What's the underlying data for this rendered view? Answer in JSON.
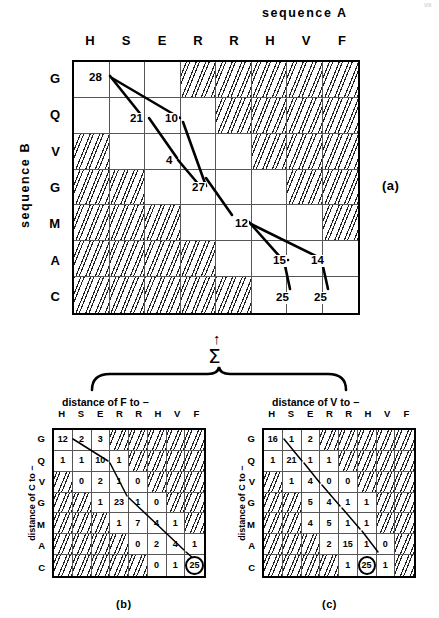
{
  "figure": {
    "sequence_a_title": "sequence A",
    "sequence_b_title": "sequence B",
    "panel_a_tag": "(a)",
    "panel_b_tag": "(b)",
    "panel_c_tag": "(c)",
    "sigma_symbol": "Σ",
    "arrow_symbol": "↑",
    "corner_mark": "VIII"
  },
  "panel_a": {
    "columns": [
      "H",
      "S",
      "E",
      "R",
      "R",
      "H",
      "V",
      "F"
    ],
    "rows": [
      "G",
      "Q",
      "V",
      "G",
      "M",
      "A",
      "C"
    ],
    "hatched": [
      [
        false,
        false,
        false,
        true,
        true,
        true,
        true,
        true
      ],
      [
        false,
        false,
        false,
        false,
        true,
        true,
        true,
        true
      ],
      [
        true,
        false,
        false,
        false,
        false,
        true,
        true,
        true
      ],
      [
        true,
        true,
        false,
        false,
        false,
        false,
        true,
        true
      ],
      [
        true,
        true,
        true,
        false,
        false,
        false,
        false,
        true
      ],
      [
        true,
        true,
        true,
        true,
        false,
        false,
        false,
        false
      ],
      [
        true,
        true,
        true,
        true,
        true,
        false,
        false,
        false
      ]
    ],
    "path_labels": [
      {
        "text": "28",
        "x": 88,
        "y": 72
      },
      {
        "text": "21",
        "x": 129,
        "y": 113
      },
      {
        "text": "10",
        "x": 164,
        "y": 113
      },
      {
        "text": "4",
        "x": 165,
        "y": 155
      },
      {
        "text": "27",
        "x": 191,
        "y": 182
      },
      {
        "text": "12",
        "x": 234,
        "y": 218
      },
      {
        "text": "15",
        "x": 272,
        "y": 255
      },
      {
        "text": "14",
        "x": 310,
        "y": 255
      },
      {
        "text": "25",
        "x": 275,
        "y": 292
      },
      {
        "text": "25",
        "x": 313,
        "y": 292
      }
    ]
  },
  "panel_b": {
    "title": "distance of  F to −",
    "side_label": "distance of C to −",
    "columns": [
      "H",
      "S",
      "E",
      "R",
      "R",
      "H",
      "V",
      "F"
    ],
    "rows": [
      "G",
      "Q",
      "V",
      "G",
      "M",
      "A",
      "C"
    ],
    "values": [
      [
        "12",
        "2",
        "3",
        "",
        "",
        "",
        "",
        ""
      ],
      [
        "1",
        "1",
        "10",
        "1",
        "",
        "",
        "",
        ""
      ],
      [
        "",
        "0",
        "2",
        "1",
        "0",
        "",
        "",
        ""
      ],
      [
        "",
        "",
        "1",
        "23",
        "1",
        "0",
        "",
        ""
      ],
      [
        "",
        "",
        "",
        "1",
        "7",
        "4",
        "1",
        ""
      ],
      [
        "",
        "",
        "",
        "",
        "0",
        "2",
        "4",
        "1"
      ],
      [
        "",
        "",
        "",
        "",
        "",
        "0",
        "1",
        "25"
      ]
    ],
    "hatched": [
      [
        false,
        false,
        false,
        true,
        true,
        true,
        true,
        true
      ],
      [
        false,
        false,
        false,
        false,
        true,
        true,
        true,
        true
      ],
      [
        true,
        false,
        false,
        false,
        false,
        true,
        true,
        true
      ],
      [
        true,
        true,
        false,
        false,
        false,
        false,
        true,
        true
      ],
      [
        true,
        true,
        true,
        false,
        false,
        false,
        false,
        true
      ],
      [
        true,
        true,
        true,
        true,
        false,
        false,
        false,
        false
      ],
      [
        true,
        true,
        true,
        true,
        true,
        false,
        false,
        false
      ]
    ],
    "circled": {
      "row": 6,
      "col": 7,
      "value": "25"
    }
  },
  "panel_c": {
    "title": "distance of  V to −",
    "side_label": "distance of C to −",
    "columns": [
      "H",
      "S",
      "E",
      "R",
      "R",
      "H",
      "V",
      "F"
    ],
    "rows": [
      "G",
      "Q",
      "V",
      "G",
      "M",
      "A",
      "C"
    ],
    "values": [
      [
        "16",
        "1",
        "2",
        "",
        "",
        "",
        "",
        ""
      ],
      [
        "1",
        "21",
        "1",
        "1",
        "",
        "",
        "",
        ""
      ],
      [
        "",
        "1",
        "4",
        "0",
        "0",
        "",
        "",
        ""
      ],
      [
        "",
        "",
        "5",
        "4",
        "1",
        "1",
        "",
        ""
      ],
      [
        "",
        "",
        "4",
        "5",
        "1",
        "1",
        "",
        ""
      ],
      [
        "",
        "",
        "",
        "2",
        "15",
        "1",
        "0",
        ""
      ],
      [
        "",
        "",
        "",
        "",
        "1",
        "25",
        "1",
        ""
      ]
    ],
    "hatched": [
      [
        false,
        false,
        false,
        true,
        true,
        true,
        true,
        true
      ],
      [
        false,
        false,
        false,
        false,
        true,
        true,
        true,
        true
      ],
      [
        true,
        false,
        false,
        false,
        false,
        true,
        true,
        true
      ],
      [
        true,
        true,
        false,
        false,
        false,
        false,
        true,
        true
      ],
      [
        true,
        true,
        false,
        false,
        false,
        false,
        true,
        true
      ],
      [
        true,
        true,
        true,
        false,
        false,
        false,
        false,
        true
      ],
      [
        true,
        true,
        true,
        true,
        false,
        false,
        false,
        true
      ]
    ],
    "circled": {
      "row": 6,
      "col": 5,
      "value": "25"
    }
  }
}
